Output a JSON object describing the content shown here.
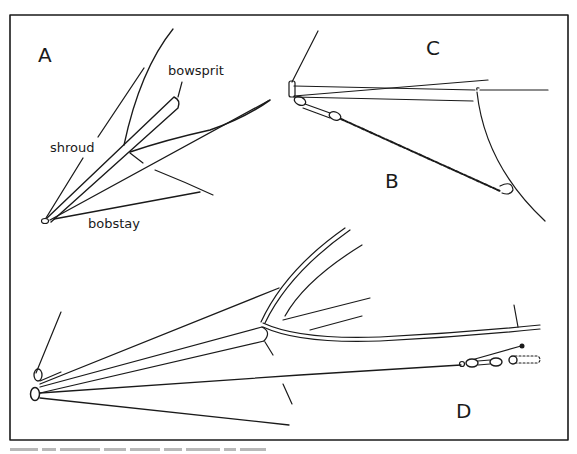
{
  "figure": {
    "panels": {
      "A": {
        "label": "A",
        "annotations": [
          "bowsprit",
          "shroud",
          "bobstay"
        ]
      },
      "B": {
        "label": "B"
      },
      "C": {
        "label": "C"
      },
      "D": {
        "label": "D"
      }
    },
    "ink_color": "#1a1a1a",
    "caption_visible": false
  }
}
